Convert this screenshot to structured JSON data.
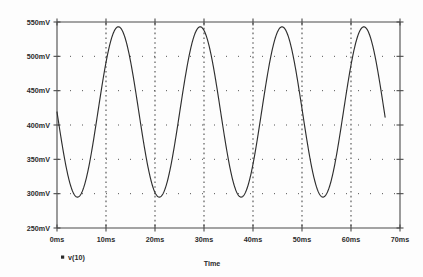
{
  "chart_data": {
    "type": "line",
    "title": "",
    "subtitle": "",
    "xlabel": "Time",
    "ylabel": "",
    "xlim": [
      0,
      70
    ],
    "ylim": [
      250,
      550
    ],
    "grid": true,
    "legend_position": "bottom-left",
    "x_unit": "ms",
    "y_unit": "mV",
    "x_ticks": [
      {
        "value": 0,
        "label": "0ms"
      },
      {
        "value": 10,
        "label": "10ms"
      },
      {
        "value": 20,
        "label": "20ms"
      },
      {
        "value": 30,
        "label": "30ms"
      },
      {
        "value": 40,
        "label": "40ms"
      },
      {
        "value": 50,
        "label": "50ms"
      },
      {
        "value": 60,
        "label": "60ms"
      },
      {
        "value": 70,
        "label": "70ms"
      }
    ],
    "y_ticks": [
      {
        "value": 250,
        "label": "250mV"
      },
      {
        "value": 300,
        "label": "300mV"
      },
      {
        "value": 350,
        "label": "350mV"
      },
      {
        "value": 400,
        "label": "400mV"
      },
      {
        "value": 450,
        "label": "450mV"
      },
      {
        "value": 500,
        "label": "500mV"
      },
      {
        "value": 550,
        "label": "550mV"
      }
    ],
    "series": [
      {
        "name": "v(10)",
        "color": "#2e2e2e",
        "marker": "square",
        "waveform": "sine",
        "amplitude_mv": 124,
        "offset_mv": 419,
        "period_ms": 16.7,
        "phase_deg": 180,
        "x_start_ms": 0,
        "x_end_ms": 67,
        "min_mv": 295,
        "max_mv": 543,
        "points": [
          {
            "x": 0.0,
            "y": 419
          },
          {
            "x": 1.0,
            "y": 374
          },
          {
            "x": 2.0,
            "y": 335
          },
          {
            "x": 3.0,
            "y": 308
          },
          {
            "x": 4.0,
            "y": 296
          },
          {
            "x": 4.2,
            "y": 295
          },
          {
            "x": 5.0,
            "y": 299
          },
          {
            "x": 6.0,
            "y": 317
          },
          {
            "x": 7.0,
            "y": 349
          },
          {
            "x": 8.0,
            "y": 389
          },
          {
            "x": 9.0,
            "y": 432
          },
          {
            "x": 10.0,
            "y": 476
          },
          {
            "x": 11.0,
            "y": 512
          },
          {
            "x": 12.0,
            "y": 536
          },
          {
            "x": 12.5,
            "y": 543
          },
          {
            "x": 13.0,
            "y": 542
          },
          {
            "x": 14.0,
            "y": 527
          },
          {
            "x": 15.0,
            "y": 499
          },
          {
            "x": 16.0,
            "y": 461
          },
          {
            "x": 17.0,
            "y": 417
          },
          {
            "x": 18.0,
            "y": 372
          },
          {
            "x": 19.0,
            "y": 334
          },
          {
            "x": 20.0,
            "y": 307
          },
          {
            "x": 20.9,
            "y": 295
          },
          {
            "x": 22.0,
            "y": 300
          },
          {
            "x": 23.0,
            "y": 320
          },
          {
            "x": 24.0,
            "y": 353
          },
          {
            "x": 25.0,
            "y": 394
          },
          {
            "x": 26.0,
            "y": 437
          },
          {
            "x": 27.0,
            "y": 480
          },
          {
            "x": 28.0,
            "y": 515
          },
          {
            "x": 29.0,
            "y": 537
          },
          {
            "x": 29.2,
            "y": 543
          },
          {
            "x": 30.0,
            "y": 541
          },
          {
            "x": 31.0,
            "y": 524
          },
          {
            "x": 32.0,
            "y": 494
          },
          {
            "x": 33.0,
            "y": 456
          },
          {
            "x": 34.0,
            "y": 412
          },
          {
            "x": 35.0,
            "y": 367
          },
          {
            "x": 36.0,
            "y": 330
          },
          {
            "x": 37.0,
            "y": 305
          },
          {
            "x": 37.6,
            "y": 295
          },
          {
            "x": 39.0,
            "y": 303
          },
          {
            "x": 40.0,
            "y": 324
          },
          {
            "x": 41.0,
            "y": 358
          },
          {
            "x": 42.0,
            "y": 399
          },
          {
            "x": 43.0,
            "y": 443
          },
          {
            "x": 44.0,
            "y": 485
          },
          {
            "x": 45.0,
            "y": 518
          },
          {
            "x": 45.9,
            "y": 543
          },
          {
            "x": 47.0,
            "y": 538
          },
          {
            "x": 48.0,
            "y": 520
          },
          {
            "x": 49.0,
            "y": 489
          },
          {
            "x": 50.0,
            "y": 450
          },
          {
            "x": 51.0,
            "y": 406
          },
          {
            "x": 52.0,
            "y": 362
          },
          {
            "x": 53.0,
            "y": 326
          },
          {
            "x": 54.0,
            "y": 303
          },
          {
            "x": 54.3,
            "y": 295
          },
          {
            "x": 56.0,
            "y": 307
          },
          {
            "x": 57.0,
            "y": 330
          },
          {
            "x": 58.0,
            "y": 366
          },
          {
            "x": 59.0,
            "y": 407
          },
          {
            "x": 60.0,
            "y": 450
          },
          {
            "x": 61.0,
            "y": 490
          },
          {
            "x": 62.0,
            "y": 521
          },
          {
            "x": 62.6,
            "y": 543
          },
          {
            "x": 64.0,
            "y": 534
          },
          {
            "x": 65.0,
            "y": 511
          },
          {
            "x": 66.0,
            "y": 474
          },
          {
            "x": 67.0,
            "y": 425
          }
        ]
      }
    ]
  },
  "legend": {
    "entries": [
      {
        "label": "v(10)",
        "marker": "square"
      }
    ]
  },
  "axes": {
    "x_title": "Time"
  }
}
